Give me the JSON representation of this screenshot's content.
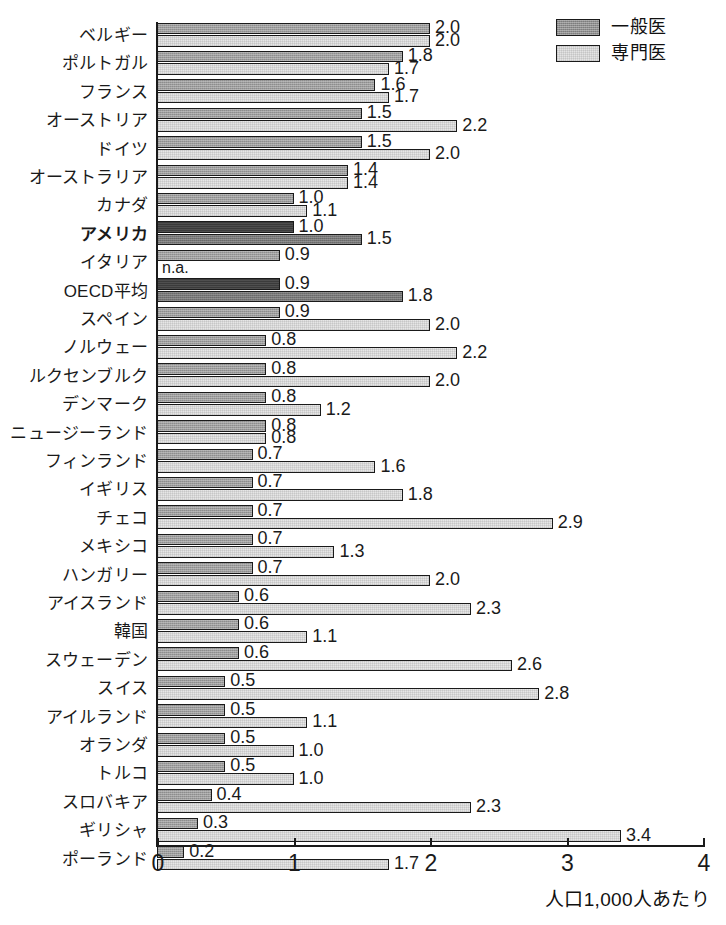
{
  "legend": {
    "position": "top-right",
    "items": [
      {
        "label": "一般医",
        "key": "gp",
        "swatch": "dark-gray-hatched"
      },
      {
        "label": "専門医",
        "key": "sp",
        "swatch": "light-gray-hatched"
      }
    ]
  },
  "axis": {
    "x_title": "人口1,000人あたり",
    "ticks": [
      "0",
      "1",
      "2",
      "3",
      "4"
    ],
    "xlim": [
      0,
      4
    ]
  },
  "na_label": "n.a.",
  "colors": {
    "gp_fill": "#9d9d9d",
    "sp_fill": "#e6e6e6",
    "gp_fill_highlight": "#3b3b3b",
    "sp_fill_highlight": "#767676",
    "outline": "#1a1a1a",
    "text": "#1a1a1a",
    "background": "#ffffff"
  },
  "chart_data": {
    "type": "bar",
    "orientation": "horizontal",
    "title": "",
    "xlabel": "人口1,000人あたり",
    "ylabel": "",
    "xlim": [
      0,
      4
    ],
    "xticks": [
      0,
      1,
      2,
      3,
      4
    ],
    "grid": false,
    "legend_position": "top-right",
    "categories": [
      "ベルギー",
      "ポルトガル",
      "フランス",
      "オーストリア",
      "ドイツ",
      "オーストラリア",
      "カナダ",
      "アメリカ",
      "イタリア",
      "OECD平均",
      "スペイン",
      "ノルウェー",
      "ルクセンブルク",
      "デンマーク",
      "ニュージーランド",
      "フィンランド",
      "イギリス",
      "チェコ",
      "メキシコ",
      "ハンガリー",
      "アイスランド",
      "韓国",
      "スウェーデン",
      "スイス",
      "アイルランド",
      "オランダ",
      "トルコ",
      "スロバキア",
      "ギリシャ",
      "ポーランド"
    ],
    "series": [
      {
        "name": "一般医",
        "key": "gp",
        "values": [
          2.0,
          1.8,
          1.6,
          1.5,
          1.5,
          1.4,
          1.0,
          1.0,
          0.9,
          0.9,
          0.9,
          0.8,
          0.8,
          0.8,
          0.8,
          0.7,
          0.7,
          0.7,
          0.7,
          0.7,
          0.6,
          0.6,
          0.6,
          0.5,
          0.5,
          0.5,
          0.5,
          0.4,
          0.3,
          0.2
        ],
        "labels": [
          "2.0",
          "1.8",
          "1.6",
          "1.5",
          "1.5",
          "1.4",
          "1.0",
          "1.0",
          "0.9",
          "0.9",
          "0.9",
          "0.8",
          "0.8",
          "0.8",
          "0.8",
          "0.7",
          "0.7",
          "0.7",
          "0.7",
          "0.7",
          "0.6",
          "0.6",
          "0.6",
          "0.5",
          "0.5",
          "0.5",
          "0.5",
          "0.4",
          "0.3",
          "0.2"
        ]
      },
      {
        "name": "専門医",
        "key": "sp",
        "values": [
          2.0,
          1.7,
          1.7,
          2.2,
          2.0,
          1.4,
          1.1,
          1.5,
          null,
          1.8,
          2.0,
          2.2,
          2.0,
          1.2,
          0.8,
          1.6,
          1.8,
          2.9,
          1.3,
          2.0,
          2.3,
          1.1,
          2.6,
          2.8,
          1.1,
          1.0,
          1.0,
          2.3,
          3.4,
          1.7
        ],
        "labels": [
          "2.0",
          "1.7",
          "1.7",
          "2.2",
          "2.0",
          "1.4",
          "1.1",
          "1.5",
          "n.a.",
          "1.8",
          "2.0",
          "2.2",
          "2.0",
          "1.2",
          "0.8",
          "1.6",
          "1.8",
          "2.9",
          "1.3",
          "2.0",
          "2.3",
          "1.1",
          "2.6",
          "2.8",
          "1.1",
          "1.0",
          "1.0",
          "2.3",
          "3.4",
          "1.7"
        ]
      }
    ],
    "highlighted_categories": [
      "アメリカ",
      "OECD平均"
    ],
    "bold_categories": [
      "アメリカ"
    ]
  }
}
